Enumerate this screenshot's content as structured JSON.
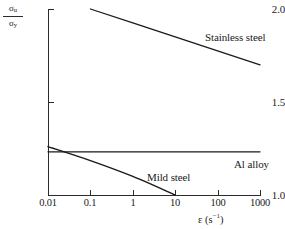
{
  "chart_data": {
    "type": "line",
    "title": "",
    "xlabel": "ε (s⁻¹)",
    "ylabel": "σu/σy",
    "xscale": "log",
    "xlim": [
      0.01,
      1000
    ],
    "ylim": [
      1.0,
      2.0
    ],
    "grid": false,
    "legend_position": "inline-annotations",
    "xticks": [
      "0.01",
      "0.1",
      "1",
      "10",
      "100",
      "1000"
    ],
    "xtick_values": [
      0.01,
      0.1,
      1,
      10,
      100,
      1000
    ],
    "yticks": [
      "1.0",
      "1.5",
      "2.0"
    ],
    "ytick_values": [
      1.0,
      1.5,
      2.0
    ],
    "series": [
      {
        "name": "Stainless steel",
        "x": [
          0.1,
          1,
          10,
          100,
          1000
        ],
        "values": [
          2.0,
          1.925,
          1.85,
          1.775,
          1.7
        ]
      },
      {
        "name": "Al alloy",
        "x": [
          0.01,
          0.1,
          1,
          10,
          100,
          1000
        ],
        "values": [
          1.232,
          1.232,
          1.232,
          1.232,
          1.232,
          1.232
        ]
      },
      {
        "name": "Mild steel",
        "x": [
          0.01,
          0.1,
          1,
          10
        ],
        "values": [
          1.26,
          1.185,
          1.1,
          1.0
        ]
      }
    ]
  },
  "axis": {
    "y_title_numerator": "σ",
    "y_title_numerator_sub": "u",
    "y_title_denominator": "σ",
    "y_title_denominator_sub": "y",
    "x_title_symbol": "ε (s",
    "x_title_exponent": "−1",
    "x_title_close": ")"
  },
  "colors": {
    "axis": "#2b2b2b",
    "series": "#1a1a1a",
    "background": "#ffffff"
  }
}
